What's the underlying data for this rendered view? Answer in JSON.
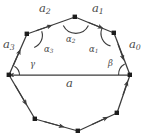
{
  "figure": {
    "background_color": "#ffffff",
    "stroke_color": "#3b3b3b",
    "label_color": "#4a4a4a",
    "width": 151,
    "height": 140
  },
  "labels": {
    "side_a2": "a",
    "side_a2_sub": "2",
    "side_a1": "a",
    "side_a1_sub": "1",
    "side_a3": "a",
    "side_a3_sub": "3",
    "side_a0": "a",
    "side_a0_sub": "0",
    "side_a": "a",
    "angle_alpha2": "α",
    "angle_alpha2_sub": "2",
    "angle_alpha3": "α",
    "angle_alpha3_sub": "3",
    "angle_alpha1": "α",
    "angle_alpha1_sub": "1",
    "angle_gamma": "γ",
    "angle_beta": "β"
  },
  "geometry": {
    "vertices": [
      {
        "name": "v-left-mid",
        "x": 9,
        "y": 75
      },
      {
        "name": "v-upper-left",
        "x": 27,
        "y": 34
      },
      {
        "name": "v-top-left",
        "x": 75,
        "y": 17
      },
      {
        "name": "v-top-right",
        "x": 114,
        "y": 33
      },
      {
        "name": "v-right-mid",
        "x": 130,
        "y": 75
      },
      {
        "name": "v-lower-right",
        "x": 117,
        "y": 113
      },
      {
        "name": "v-bottom-right",
        "x": 78,
        "y": 131
      },
      {
        "name": "v-bottom-left",
        "x": 35,
        "y": 119
      }
    ],
    "chord": {
      "name": "base-chord-a",
      "from": [
        9,
        75
      ],
      "to": [
        130,
        75
      ]
    },
    "arrow_edges": [
      "a0-right-upper",
      "a1-top-right",
      "a2-top-left",
      "a3-left-upper",
      "base-chord-a",
      "lower-left-edge",
      "bottom-left-edge",
      "bottom-right-edge",
      "lower-right-edge"
    ]
  }
}
